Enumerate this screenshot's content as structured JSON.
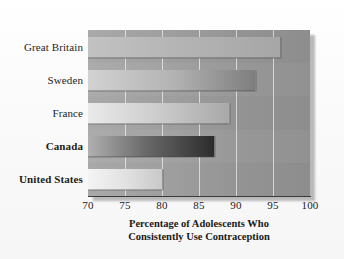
{
  "chart_data": {
    "type": "bar",
    "orientation": "horizontal",
    "title": "",
    "subtitle": "",
    "xlabel_line1": "Percentage of Adolescents Who",
    "xlabel_line2": "Consistently Use Contraception",
    "ylabel": "",
    "categories": [
      "Great Britain",
      "Sweden",
      "France",
      "Canada",
      "United States"
    ],
    "values": [
      96,
      92.5,
      89,
      87,
      80
    ],
    "xlim": [
      70,
      100
    ],
    "xticks": [
      70,
      75,
      80,
      85,
      90,
      95,
      100
    ],
    "xtick_labels": [
      "70",
      "75",
      "80",
      "85",
      "90",
      "95",
      "100"
    ],
    "grid": true,
    "grid_axis": "x",
    "legend": false,
    "emphasized_categories": [
      "Canada",
      "United States"
    ],
    "bar_colors": [
      "#b5b5b5",
      "#b4b4b4",
      "#cfcfcf",
      "#6a6a6a",
      "#e2e2e2"
    ],
    "plot_background_color": "#9d9d9d",
    "figure_background_color": "#fdfdfd",
    "axis_line_color": "#3a3a3a",
    "gridline_color": "#ffffff",
    "text_color": "#1d1d1d"
  },
  "axis": {
    "x": {
      "ticks": [
        {
          "value": 70,
          "label": "70"
        },
        {
          "value": 75,
          "label": "75"
        },
        {
          "value": 80,
          "label": "80"
        },
        {
          "value": 85,
          "label": "85"
        },
        {
          "value": 90,
          "label": "90"
        },
        {
          "value": 95,
          "label": "95"
        },
        {
          "value": 100,
          "label": "100"
        }
      ],
      "title_lines": [
        "Percentage of Adolescents Who",
        "Consistently Use Contraception"
      ]
    },
    "y": {
      "categories": [
        {
          "label": "Great Britain",
          "bold": false
        },
        {
          "label": "Sweden",
          "bold": false
        },
        {
          "label": "France",
          "bold": false
        },
        {
          "label": "Canada",
          "bold": true
        },
        {
          "label": "United States",
          "bold": true
        }
      ]
    }
  },
  "bars": [
    {
      "label": "Great Britain",
      "value": 96
    },
    {
      "label": "Sweden",
      "value": 92.5
    },
    {
      "label": "France",
      "value": 89
    },
    {
      "label": "Canada",
      "value": 87
    },
    {
      "label": "United States",
      "value": 80
    }
  ]
}
